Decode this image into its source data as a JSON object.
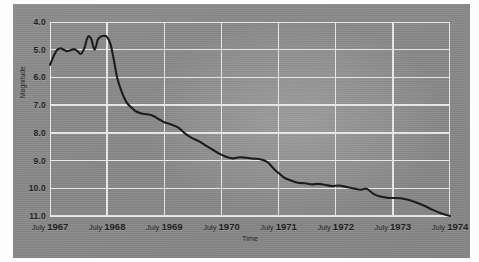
{
  "chart_data": {
    "type": "line",
    "title": "",
    "xlabel": "Time",
    "ylabel": "Magnitude",
    "y_inverted": true,
    "ylim": [
      4.0,
      11.0
    ],
    "xlim": [
      "July 1967",
      "July 1974"
    ],
    "grid": true,
    "legend": "none",
    "y_ticks": [
      "4.0",
      "5.0",
      "6.0",
      "7.0",
      "8.0",
      "9.0",
      "10.0",
      "11.0"
    ],
    "y_tick_values": [
      4.0,
      5.0,
      6.0,
      7.0,
      8.0,
      9.0,
      10.0,
      11.0
    ],
    "x_ticks": [
      {
        "month": "July",
        "year": "1967"
      },
      {
        "month": "July",
        "year": "1968"
      },
      {
        "month": "July",
        "year": "1969"
      },
      {
        "month": "July",
        "year": "1970"
      },
      {
        "month": "July",
        "year": "1971"
      },
      {
        "month": "July",
        "year": "1972"
      },
      {
        "month": "July",
        "year": "1973"
      },
      {
        "month": "July",
        "year": "1974"
      }
    ],
    "x_tick_values": [
      1967.5,
      1968.5,
      1969.5,
      1970.5,
      1971.5,
      1972.5,
      1973.5,
      1974.5
    ],
    "series": [
      {
        "name": "Magnitude",
        "color": "#1a1a1a",
        "x": [
          1967.5,
          1967.56,
          1967.62,
          1967.68,
          1967.74,
          1967.8,
          1967.86,
          1967.92,
          1967.98,
          1968.04,
          1968.1,
          1968.16,
          1968.22,
          1968.28,
          1968.34,
          1968.4,
          1968.46,
          1968.5,
          1968.56,
          1968.62,
          1968.68,
          1968.76,
          1968.84,
          1968.92,
          1969.0,
          1969.1,
          1969.2,
          1969.3,
          1969.4,
          1969.5,
          1969.62,
          1969.74,
          1969.86,
          1969.98,
          1970.1,
          1970.22,
          1970.34,
          1970.46,
          1970.58,
          1970.7,
          1970.82,
          1970.94,
          1971.06,
          1971.18,
          1971.3,
          1971.42,
          1971.5,
          1971.6,
          1971.72,
          1971.84,
          1971.96,
          1972.08,
          1972.2,
          1972.32,
          1972.44,
          1972.56,
          1972.68,
          1972.8,
          1972.92,
          1973.04,
          1973.16,
          1973.28,
          1973.4,
          1973.5,
          1973.64,
          1973.78,
          1973.92,
          1974.06,
          1974.2,
          1974.34,
          1974.5
        ],
        "y": [
          5.55,
          5.25,
          5.02,
          4.95,
          5.0,
          5.05,
          5.02,
          4.98,
          5.05,
          5.15,
          4.95,
          4.55,
          4.6,
          5.0,
          4.62,
          4.52,
          4.5,
          4.55,
          4.8,
          5.4,
          6.05,
          6.55,
          6.9,
          7.08,
          7.22,
          7.3,
          7.33,
          7.38,
          7.5,
          7.62,
          7.7,
          7.8,
          8.02,
          8.18,
          8.3,
          8.45,
          8.6,
          8.75,
          8.86,
          8.92,
          8.88,
          8.9,
          8.93,
          8.95,
          9.05,
          9.3,
          9.45,
          9.62,
          9.72,
          9.8,
          9.82,
          9.86,
          9.84,
          9.88,
          9.92,
          9.9,
          9.95,
          10.0,
          10.05,
          10.02,
          10.2,
          10.3,
          10.34,
          10.35,
          10.36,
          10.42,
          10.52,
          10.64,
          10.78,
          10.9,
          11.0
        ]
      }
    ]
  },
  "axis_titles": {
    "x": "Time",
    "y": "Magnitude"
  }
}
